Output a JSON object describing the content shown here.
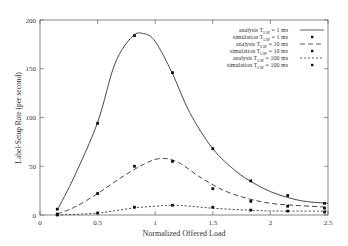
{
  "chart_data": {
    "type": "line",
    "title": "",
    "xlabel": "Normalized Offered Load",
    "ylabel": "Label-Setup Rate (per second)",
    "xlim": [
      0,
      2.5
    ],
    "ylim": [
      0,
      200
    ],
    "x_ticks": [
      "0",
      "0.5",
      "1",
      "1.5",
      "2",
      "2.5"
    ],
    "y_ticks": [
      "0",
      "50",
      "100",
      "150",
      "200"
    ],
    "grid": false,
    "legend_position": "top-right",
    "series": [
      {
        "name": "analysis T_LSP = 1 ms",
        "style": "solid",
        "x": [
          0.15,
          0.3,
          0.5,
          0.65,
          0.8,
          0.9,
          1.0,
          1.15,
          1.3,
          1.5,
          1.7,
          1.85,
          2.0,
          2.15,
          2.3,
          2.5
        ],
        "y": [
          5,
          40,
          95,
          155,
          183,
          186,
          178,
          145,
          105,
          68,
          45,
          33,
          24,
          18,
          14,
          12
        ]
      },
      {
        "name": "simulation T_LSP = 1 ms",
        "style": "marker",
        "x": [
          0.15,
          0.5,
          0.82,
          1.15,
          1.5,
          1.83,
          2.15,
          2.47
        ],
        "y": [
          6,
          94,
          184,
          146,
          68,
          35,
          20,
          12
        ]
      },
      {
        "name": "analysis T_LSP = 10 ms",
        "style": "dashed",
        "x": [
          0.15,
          0.3,
          0.5,
          0.7,
          0.9,
          1.05,
          1.2,
          1.4,
          1.6,
          1.8,
          2.0,
          2.2,
          2.5
        ],
        "y": [
          1,
          8,
          22,
          38,
          52,
          58,
          54,
          38,
          25,
          17,
          12,
          10,
          8
        ]
      },
      {
        "name": "simulation T_LSP = 10 ms",
        "style": "marker",
        "x": [
          0.15,
          0.5,
          0.82,
          1.15,
          1.5,
          1.83,
          2.15,
          2.47
        ],
        "y": [
          1,
          22,
          50,
          55,
          27,
          14,
          9,
          7
        ]
      },
      {
        "name": "analysis T_LSP = 100 ms",
        "style": "dotted",
        "x": [
          0.15,
          0.5,
          0.8,
          1.0,
          1.15,
          1.3,
          1.5,
          1.8,
          2.1,
          2.5
        ],
        "y": [
          0,
          2,
          7,
          9,
          10,
          9,
          7,
          5,
          4,
          4
        ]
      },
      {
        "name": "simulation T_LSP = 100 ms",
        "style": "marker",
        "x": [
          0.15,
          0.5,
          0.82,
          1.15,
          1.5,
          1.83,
          2.15,
          2.47
        ],
        "y": [
          0,
          2,
          8,
          10,
          8,
          5,
          4,
          3
        ]
      }
    ]
  },
  "legend": [
    {
      "label": "analysis  T",
      "sub": "LSP",
      "tail": " = 1 ms",
      "style": "solid"
    },
    {
      "label": "simulation  T",
      "sub": "LSP",
      "tail": " = 1 ms",
      "style": "marker"
    },
    {
      "label": "analysis  T",
      "sub": "LSP",
      "tail": " = 10 ms",
      "style": "dashed"
    },
    {
      "label": "simulation  T",
      "sub": "LSP",
      "tail": " = 10 ms",
      "style": "marker"
    },
    {
      "label": "analysis  T",
      "sub": "LSP",
      "tail": " = 100 ms",
      "style": "dotted"
    },
    {
      "label": "simulation  T",
      "sub": "LSP",
      "tail": " = 100 ms",
      "style": "marker"
    }
  ]
}
